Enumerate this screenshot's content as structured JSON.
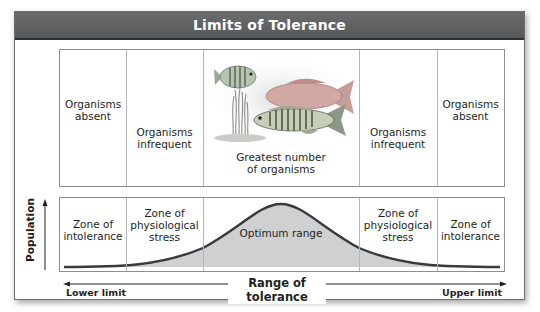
{
  "title": "Limits of Tolerance",
  "top_panel": {
    "cells": [
      {
        "label": "Organisms absent",
        "lines": [
          "Organisms",
          "absent"
        ]
      },
      {
        "label": "Organisms infrequent",
        "lines": [
          "Organisms",
          "infrequent"
        ]
      },
      {
        "label": "Greatest number of organisms",
        "lines": [
          "Greatest number",
          "of organisms"
        ],
        "image": "fish-illustration"
      },
      {
        "label": "Organisms infrequent",
        "lines": [
          "Organisms",
          "infrequent"
        ]
      },
      {
        "label": "Organisms absent",
        "lines": [
          "Organisms",
          "absent"
        ]
      }
    ]
  },
  "bottom_panel": {
    "cells": [
      {
        "label": "Zone of intolerance",
        "lines": [
          "Zone of",
          "intolerance"
        ]
      },
      {
        "label": "Zone of physiological stress",
        "lines": [
          "Zone of",
          "physiological",
          "stress"
        ]
      },
      {
        "label": "Optimum range",
        "lines": [
          "Optimum range"
        ]
      },
      {
        "label": "Zone of physiological stress",
        "lines": [
          "Zone of",
          "physiological",
          "stress"
        ]
      },
      {
        "label": "Zone of intolerance",
        "lines": [
          "Zone of",
          "intolerance"
        ]
      }
    ],
    "curve": "bell-curve",
    "colors": {
      "curve_stroke": "#3a3a3c",
      "curve_fill": "#cfd0d2"
    }
  },
  "axes": {
    "y_label": "Population",
    "x_label": "Range of tolerance",
    "lower_limit": "Lower limit",
    "upper_limit": "Upper limit"
  },
  "colors": {
    "header_bg": "#606163",
    "header_text": "#ffffff",
    "border": "#8c8d8f"
  }
}
